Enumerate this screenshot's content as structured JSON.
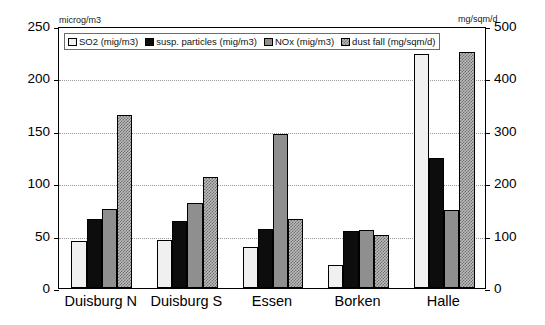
{
  "chart_data": {
    "type": "bar",
    "title": "",
    "subtitle": "",
    "xlabel": "",
    "ylabel": "microg/m3",
    "y2label": "mg/sqm/d",
    "ylim": [
      0,
      250
    ],
    "y2lim": [
      0,
      500
    ],
    "yticks": [
      "0",
      "50",
      "100",
      "150",
      "200",
      "250"
    ],
    "y2ticks": [
      "0",
      "100",
      "200",
      "300",
      "400",
      "500"
    ],
    "grid": true,
    "legend_position": "top-left-inside",
    "categories": [
      "Duisburg N",
      "Duisburg S",
      "Essen",
      "Borken",
      "Halle"
    ],
    "series": [
      {
        "name": "SO2 (mig/m3)",
        "axis": "left",
        "color": "#f0f0f0",
        "values": [
          45,
          46,
          39,
          22,
          223
        ]
      },
      {
        "name": "susp. particles (mig/m3)",
        "axis": "left",
        "color": "#0d0d0d",
        "values": [
          66,
          64,
          56,
          54,
          124
        ]
      },
      {
        "name": "NOx (mig/m3)",
        "axis": "left",
        "color": "#8f8f8f",
        "values": [
          75,
          81,
          147,
          55,
          74
        ]
      },
      {
        "name": "dust fall (mg/sqm/d)",
        "axis": "right",
        "color": "#bdbdbd",
        "values": [
          330,
          212,
          132,
          102,
          450
        ]
      }
    ]
  },
  "axes": {
    "left_unit": "microg/m3",
    "right_unit": "mg/sqm/d"
  },
  "legend": {
    "items": [
      {
        "label": "SO2 (mig/m3)"
      },
      {
        "label": "susp. particles (mig/m3)"
      },
      {
        "label": "NOx (mig/m3)"
      },
      {
        "label": "dust fall (mg/sqm/d)"
      }
    ]
  }
}
